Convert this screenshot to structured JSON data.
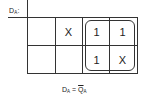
{
  "map": {
    "label_main": "D",
    "label_sub": "A",
    "label_suffix": ":",
    "rows": [
      [
        "",
        "X",
        "1",
        "1"
      ],
      [
        "",
        "",
        "1",
        "X"
      ]
    ],
    "grouping": {
      "rows": [
        0,
        1
      ],
      "cols": [
        2,
        3
      ]
    }
  },
  "equation": {
    "lhs_main": "D",
    "lhs_sub": "A",
    "equals": "=",
    "rhs_main": "Q",
    "rhs_sub": "A",
    "rhs_negated": true
  }
}
